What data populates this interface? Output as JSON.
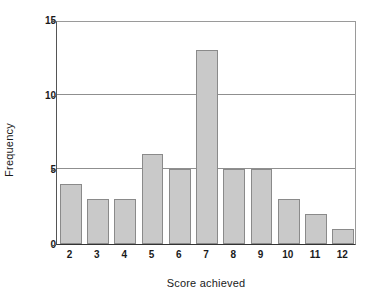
{
  "chart_data": {
    "type": "bar",
    "title": "",
    "xlabel": "Score achieved",
    "ylabel": "Frequency",
    "categories": [
      "2",
      "3",
      "4",
      "5",
      "6",
      "7",
      "8",
      "9",
      "10",
      "11",
      "12"
    ],
    "values": [
      4,
      3,
      3,
      6,
      5,
      13,
      5,
      5,
      3,
      2,
      1
    ],
    "ylim": [
      0,
      15
    ],
    "yticks": [
      0,
      5,
      10,
      15
    ],
    "ytick_labels": [
      "0",
      "5",
      "10",
      "15"
    ],
    "grid": "horizontal",
    "legend": "none",
    "bar_fill_color": "#c9c9c9",
    "bar_border_color": "#8a8a8a",
    "gridline_color": "#8f8f8f",
    "axis_color": "#333333",
    "background_color": "#ffffff"
  }
}
